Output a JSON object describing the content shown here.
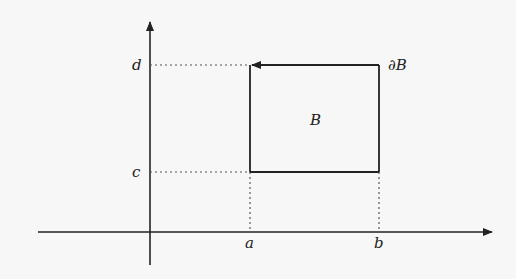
{
  "diagram": {
    "region_label": "B",
    "boundary_label": "∂B",
    "x_ticks": {
      "a": "a",
      "b": "b"
    },
    "y_ticks": {
      "c": "c",
      "d": "d"
    },
    "colors": {
      "stroke": "#222222",
      "dotted": "#555555",
      "background": "#f7f7f7"
    }
  }
}
